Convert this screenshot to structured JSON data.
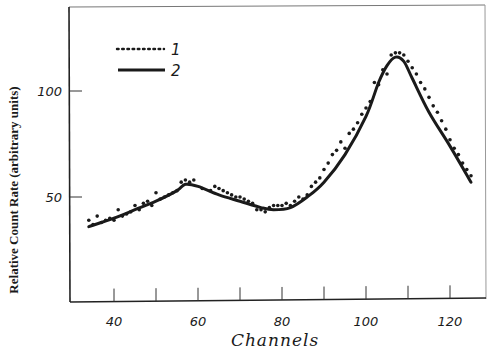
{
  "chart_data": {
    "type": "line",
    "title": "",
    "xlabel": "Channels",
    "ylabel": "Relative Count Rate (arbitrary units)",
    "xlim": [
      32,
      128
    ],
    "ylim": [
      0,
      139
    ],
    "x_ticks": [
      40,
      50,
      60,
      70,
      80,
      90,
      100,
      110,
      120
    ],
    "x_tick_labels": [
      "40",
      "60",
      "80",
      "100",
      "120"
    ],
    "x_tick_label_values": [
      40,
      60,
      80,
      100,
      120
    ],
    "y_ticks": [
      50,
      100
    ],
    "y_tick_labels": [
      "50",
      "100"
    ],
    "grid": false,
    "legend": {
      "position": "upper-left",
      "entries": [
        {
          "label": "1",
          "style": "dotted"
        },
        {
          "label": "2",
          "style": "solid"
        }
      ]
    },
    "series": [
      {
        "name": "1",
        "style": "points",
        "x": [
          34,
          35,
          36,
          37,
          38,
          39,
          40,
          41,
          42,
          43,
          44,
          45,
          46,
          47,
          48,
          49,
          50,
          51,
          52,
          53,
          54,
          55,
          56,
          57,
          58,
          59,
          61,
          63,
          64,
          65,
          66,
          67,
          68,
          69,
          70,
          71,
          72,
          73,
          74,
          75,
          76,
          77,
          78,
          79,
          80,
          81,
          82,
          83,
          84,
          85,
          86,
          87,
          88,
          89,
          90,
          91,
          92,
          93,
          94,
          95,
          96,
          97,
          98,
          99,
          100,
          101,
          102,
          103,
          104,
          105,
          106,
          107,
          108,
          109,
          110,
          111,
          112,
          113,
          114,
          115,
          116,
          117,
          118,
          119,
          120,
          121,
          122,
          123,
          124,
          125
        ],
        "y": [
          39,
          37,
          41,
          38,
          39,
          40,
          39,
          44,
          41,
          42,
          43,
          46,
          44,
          47,
          48,
          46,
          52,
          49,
          50,
          51,
          52,
          53,
          57,
          58,
          57,
          58,
          54,
          53,
          55,
          54,
          53,
          52,
          51,
          50,
          50,
          49,
          48,
          47,
          44,
          44,
          43,
          45,
          46,
          46,
          46,
          47,
          46,
          48,
          50,
          49,
          51,
          55,
          57,
          59,
          63,
          66,
          70,
          72,
          76,
          73,
          80,
          82,
          85,
          89,
          92,
          95,
          104,
          103,
          110,
          108,
          117,
          118,
          118,
          117,
          114,
          111,
          108,
          104,
          101,
          97,
          93,
          90,
          86,
          82,
          77,
          73,
          70,
          66,
          63,
          60
        ]
      },
      {
        "name": "2",
        "style": "solid",
        "x": [
          34,
          40,
          45,
          50,
          55,
          57,
          60,
          65,
          70,
          75,
          78,
          82,
          86,
          90,
          95,
          100,
          103,
          105,
          107,
          109,
          111,
          115,
          120,
          125
        ],
        "y": [
          36,
          40,
          44,
          48,
          53,
          56,
          55,
          51,
          48,
          45,
          44,
          45,
          50,
          57,
          70,
          88,
          104,
          112,
          116,
          114,
          106,
          90,
          74,
          57
        ]
      }
    ]
  }
}
